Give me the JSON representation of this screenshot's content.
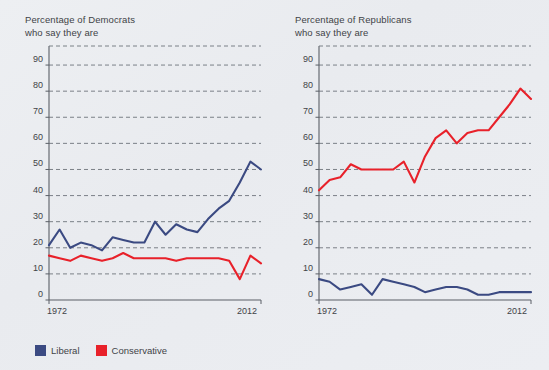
{
  "figure": {
    "background_color": "#eceef1",
    "text_color": "#3f4347"
  },
  "legend": {
    "position": "bottom-left",
    "entries": [
      {
        "label": "Liberal",
        "color": "#3b4a82"
      },
      {
        "label": "Conservative",
        "color": "#e8212a"
      }
    ]
  },
  "panels": {
    "left": {
      "title": "Percentage of Democrats\nwho say they are",
      "y_ticks": [
        "90",
        "80",
        "70",
        "60",
        "50",
        "40",
        "30",
        "20",
        "10",
        "0"
      ],
      "x_ticks": [
        "1972",
        "2012"
      ]
    },
    "right": {
      "title": "Percentage of Republicans\nwho say they are",
      "y_ticks": [
        "90",
        "80",
        "70",
        "60",
        "50",
        "40",
        "30",
        "20",
        "10",
        "0"
      ],
      "x_ticks": [
        "1972",
        "2012"
      ]
    }
  },
  "chart_data": [
    {
      "type": "line",
      "title": "Percentage of Democrats who say they are",
      "xlabel": "",
      "ylabel": "",
      "xlim": [
        1972,
        2012
      ],
      "ylim": [
        0,
        95
      ],
      "yticks": [
        0,
        10,
        20,
        30,
        40,
        50,
        60,
        70,
        80,
        90
      ],
      "xticks": [
        1972,
        2012
      ],
      "grid": "horizontal-dashed",
      "legend_position": "below-figure",
      "x": [
        1972,
        1974,
        1976,
        1978,
        1980,
        1982,
        1984,
        1986,
        1988,
        1990,
        1992,
        1994,
        1996,
        1998,
        2000,
        2002,
        2004,
        2006,
        2008,
        2010,
        2012
      ],
      "series": [
        {
          "name": "Liberal",
          "color": "#3b4a82",
          "values": [
            21,
            27,
            20,
            22,
            21,
            19,
            24,
            23,
            22,
            22,
            30,
            25,
            29,
            27,
            26,
            31,
            35,
            38,
            45,
            53,
            50
          ]
        },
        {
          "name": "Conservative",
          "color": "#e8212a",
          "values": [
            17,
            16,
            15,
            17,
            16,
            15,
            16,
            18,
            16,
            16,
            16,
            16,
            15,
            16,
            16,
            16,
            16,
            15,
            8,
            17,
            14
          ]
        }
      ]
    },
    {
      "type": "line",
      "title": "Percentage of Republicans who say they are",
      "xlabel": "",
      "ylabel": "",
      "xlim": [
        1972,
        2012
      ],
      "ylim": [
        0,
        95
      ],
      "yticks": [
        0,
        10,
        20,
        30,
        40,
        50,
        60,
        70,
        80,
        90
      ],
      "xticks": [
        1972,
        2012
      ],
      "grid": "horizontal-dashed",
      "legend_position": "below-figure",
      "x": [
        1972,
        1974,
        1976,
        1978,
        1980,
        1982,
        1984,
        1986,
        1988,
        1990,
        1992,
        1994,
        1996,
        1998,
        2000,
        2002,
        2004,
        2006,
        2008,
        2010,
        2012
      ],
      "series": [
        {
          "name": "Liberal",
          "color": "#3b4a82",
          "values": [
            8,
            7,
            4,
            5,
            6,
            2,
            8,
            7,
            6,
            5,
            3,
            4,
            5,
            5,
            4,
            2,
            2,
            3,
            3,
            3,
            3
          ]
        },
        {
          "name": "Conservative",
          "color": "#e8212a",
          "values": [
            42,
            46,
            47,
            52,
            50,
            50,
            50,
            50,
            53,
            45,
            55,
            62,
            65,
            60,
            64,
            65,
            65,
            70,
            75,
            81,
            77
          ]
        }
      ]
    }
  ]
}
